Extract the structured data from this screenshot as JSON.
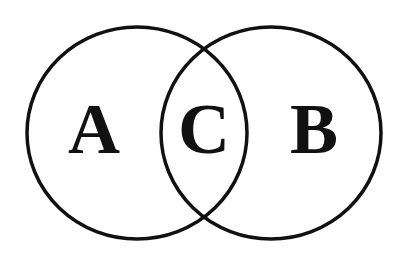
{
  "diagram": {
    "type": "venn",
    "stroke_color": "#111111",
    "background": "#ffffff",
    "sets": [
      {
        "id": "A",
        "label": "A",
        "region": "left-circle-only"
      },
      {
        "id": "B",
        "label": "B",
        "region": "right-circle-only"
      }
    ],
    "intersection": {
      "id": "C",
      "label": "C",
      "region": "overlap-of-A-and-B"
    }
  }
}
